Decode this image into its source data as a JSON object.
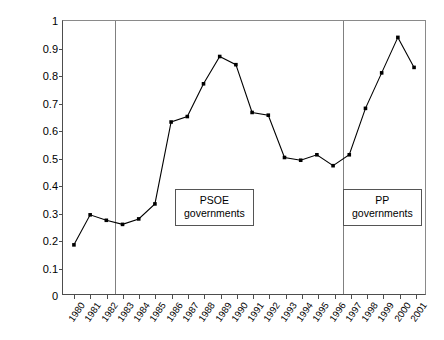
{
  "chart_data": {
    "type": "line",
    "title": "",
    "xlabel": "",
    "ylabel": "ALMP as % of GDP",
    "ylim": [
      0,
      1
    ],
    "yticks": [
      "0",
      "0.1",
      "0.2",
      "0.3",
      "0.4",
      "0.5",
      "0.6",
      "0.7",
      "0.8",
      "0.9",
      "1"
    ],
    "grid": false,
    "legend": "none",
    "marker": "filled-square",
    "line_color": "#000000",
    "categories": [
      "1980",
      "1981",
      "1982",
      "1983",
      "1984",
      "1985",
      "1986",
      "1987",
      "1988",
      "1989",
      "1990",
      "1991",
      "1992",
      "1993",
      "1994",
      "1995",
      "1996",
      "1997",
      "1998",
      "1999",
      "2000",
      "2001"
    ],
    "values": [
      0.18,
      0.29,
      0.27,
      0.255,
      0.275,
      0.33,
      0.63,
      0.65,
      0.77,
      0.87,
      0.84,
      0.665,
      0.655,
      0.5,
      0.49,
      0.51,
      0.47,
      0.51,
      0.68,
      0.81,
      0.94,
      0.83
    ],
    "annotations": [
      {
        "line1": "PSOE",
        "line2": "governments"
      },
      {
        "line1": "PP",
        "line2": "governments"
      }
    ],
    "dividers": [
      {
        "after_category": "1982"
      },
      {
        "after_category": "1996"
      }
    ]
  }
}
